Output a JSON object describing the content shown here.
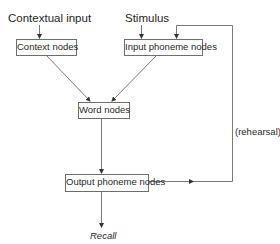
{
  "diagram": {
    "inputs": {
      "contextual_input": "Contextual input",
      "stimulus": "Stimulus"
    },
    "nodes": {
      "context_nodes": "Context nodes",
      "input_phoneme_nodes": "Input phoneme nodes",
      "word_nodes": "Word nodes",
      "output_phoneme_nodes": "Output phoneme nodes"
    },
    "outputs": {
      "recall": "Recall"
    },
    "edge_labels": {
      "rehearsal": "(rehearsal)"
    },
    "edges": [
      {
        "from": "Contextual input",
        "to": "Context nodes"
      },
      {
        "from": "Stimulus",
        "to": "Input phoneme nodes"
      },
      {
        "from": "Context nodes",
        "to": "Word nodes"
      },
      {
        "from": "Input phoneme nodes",
        "to": "Word nodes"
      },
      {
        "from": "Word nodes",
        "to": "Output phoneme nodes"
      },
      {
        "from": "Output phoneme nodes",
        "to": "Recall"
      },
      {
        "from": "Output phoneme nodes",
        "to": "Input phoneme nodes",
        "label": "(rehearsal)"
      }
    ],
    "colors": {
      "line": "#7a7a7a",
      "text": "#222222",
      "box_border": "#6e6e6e"
    }
  }
}
